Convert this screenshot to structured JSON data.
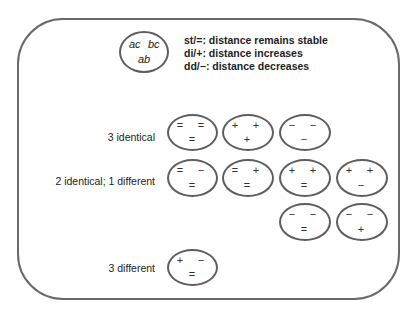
{
  "key": {
    "top_left": "ac",
    "top_right": "bc",
    "bottom": "ab"
  },
  "legend": [
    "st/=: distance remains stable",
    "di/+: distance increases",
    "dd/−: distance decreases"
  ],
  "rows": [
    {
      "label": "3 identical",
      "combos": [
        {
          "ac": "=",
          "bc": "=",
          "ab": "="
        },
        {
          "ac": "+",
          "bc": "+",
          "ab": "+"
        },
        {
          "ac": "−",
          "bc": "−",
          "ab": "−"
        }
      ]
    },
    {
      "label": "2 identical; 1 different",
      "combos": [
        {
          "ac": "=",
          "bc": "−",
          "ab": "="
        },
        {
          "ac": "=",
          "bc": "+",
          "ab": "="
        },
        {
          "ac": "+",
          "bc": "+",
          "ab": "="
        },
        {
          "ac": "+",
          "bc": "+",
          "ab": "−"
        },
        {
          "ac": "−",
          "bc": "−",
          "ab": "="
        },
        {
          "ac": "−",
          "bc": "−",
          "ab": "+"
        }
      ]
    },
    {
      "label": "3 different",
      "combos": [
        {
          "ac": "+",
          "bc": "−",
          "ab": "="
        }
      ]
    }
  ]
}
